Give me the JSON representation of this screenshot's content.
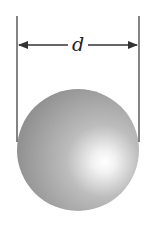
{
  "diagram": {
    "dimension_label": "d",
    "colors": {
      "line": "#333333",
      "sphere_dark": "#8a8a8a",
      "sphere_mid": "#b0b0b0",
      "sphere_highlight": "#ffffff",
      "background": "#ffffff"
    }
  }
}
